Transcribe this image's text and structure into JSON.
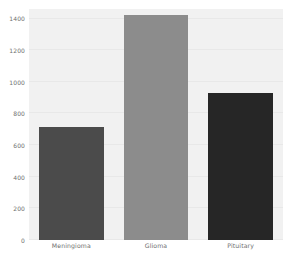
{
  "chart_data": {
    "type": "bar",
    "title": "",
    "subtitle": "",
    "xlabel": "",
    "ylabel": "",
    "categories": [
      "Meningioma",
      "Glioma",
      "Pituitary"
    ],
    "values": [
      716,
      1425,
      927
    ],
    "series": [
      {
        "name": "count",
        "values": [
          716,
          1425,
          927
        ]
      }
    ],
    "bar_colors": [
      "#4b4b4b",
      "#8c8c8c",
      "#262626"
    ],
    "ylim": [
      0,
      1460
    ],
    "xlim": [
      0,
      3
    ],
    "yticks": [
      0,
      200,
      400,
      600,
      800,
      1000,
      1200,
      1400
    ],
    "ytick_labels": [
      "0",
      "200",
      "400",
      "600",
      "800",
      "1000",
      "1200",
      "1400"
    ],
    "xtick_labels": [
      "Meningioma",
      "Glioma",
      "Pituitary"
    ],
    "grid": true,
    "grid_axis": "y",
    "legend": false,
    "legend_position": "none",
    "annotations": [],
    "plot_background_color": "#f1f1f1",
    "figure_background_color": "#ffffff",
    "gridline_color": "#e8e8e8",
    "tick_label_color": "#6f6f6f",
    "bar_width_fraction": 0.76
  }
}
